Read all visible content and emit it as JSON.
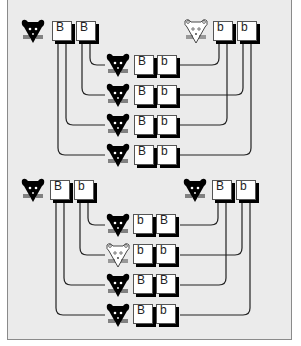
{
  "diagram": {
    "type": "monohybrid-cross",
    "colors": {
      "background": "#ebebeb",
      "border": "#8a8a8a",
      "dominant_phenotype": "#000000",
      "recessive_phenotype": "#ffffff",
      "wire": "#222222"
    },
    "crosses": [
      {
        "name": "cross-1",
        "parents": [
          {
            "phenotype": "black",
            "alleles": [
              "B",
              "B"
            ]
          },
          {
            "phenotype": "white",
            "alleles": [
              "b",
              "b"
            ]
          }
        ],
        "offspring": [
          {
            "phenotype": "black",
            "alleles": [
              "B",
              "b"
            ]
          },
          {
            "phenotype": "black",
            "alleles": [
              "B",
              "b"
            ]
          },
          {
            "phenotype": "black",
            "alleles": [
              "B",
              "b"
            ]
          },
          {
            "phenotype": "black",
            "alleles": [
              "B",
              "b"
            ]
          }
        ]
      },
      {
        "name": "cross-2",
        "parents": [
          {
            "phenotype": "black",
            "alleles": [
              "B",
              "b"
            ]
          },
          {
            "phenotype": "black",
            "alleles": [
              "B",
              "b"
            ]
          }
        ],
        "offspring": [
          {
            "phenotype": "black",
            "alleles": [
              "b",
              "B"
            ]
          },
          {
            "phenotype": "white",
            "alleles": [
              "b",
              "b"
            ]
          },
          {
            "phenotype": "black",
            "alleles": [
              "B",
              "B"
            ]
          },
          {
            "phenotype": "black",
            "alleles": [
              "B",
              "b"
            ]
          }
        ]
      }
    ]
  }
}
